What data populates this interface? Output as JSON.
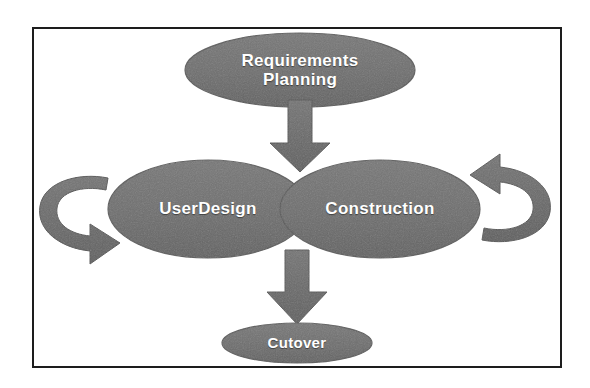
{
  "diagram": {
    "type": "process-flow",
    "background_color": "#ffffff",
    "frame_color": "#1d1d1d",
    "shape_fill_color": "#6e6e6e",
    "shape_stroke_color": "#5a5a5a",
    "label_color": "#ffffff",
    "nodes": [
      {
        "id": "requirements-planning",
        "label": "Requirements\nPlanning",
        "shape": "ellipse",
        "cx": 300,
        "cy": 70,
        "rx": 115,
        "ry": 37
      },
      {
        "id": "user-design",
        "label": "UserDesign",
        "shape": "ellipse",
        "cx": 208,
        "cy": 209,
        "rx": 100,
        "ry": 49
      },
      {
        "id": "construction",
        "label": "Construction",
        "shape": "ellipse",
        "cx": 380,
        "cy": 209,
        "rx": 100,
        "ry": 49
      },
      {
        "id": "cutover",
        "label": "Cutover",
        "shape": "ellipse",
        "cx": 297,
        "cy": 343,
        "rx": 75,
        "ry": 20
      }
    ],
    "connectors": [
      {
        "id": "arrow-planning-to-design",
        "kind": "block-arrow-down",
        "from": "requirements-planning",
        "to": "user-design"
      },
      {
        "id": "arrow-construction-to-cutover",
        "kind": "block-arrow-down",
        "from": "construction",
        "to": "cutover"
      },
      {
        "id": "loop-arrow-left",
        "kind": "circular-arrow",
        "direction": "clockwise-right",
        "side": "left"
      },
      {
        "id": "loop-arrow-right",
        "kind": "circular-arrow",
        "direction": "counterclockwise-left",
        "side": "right"
      }
    ]
  }
}
